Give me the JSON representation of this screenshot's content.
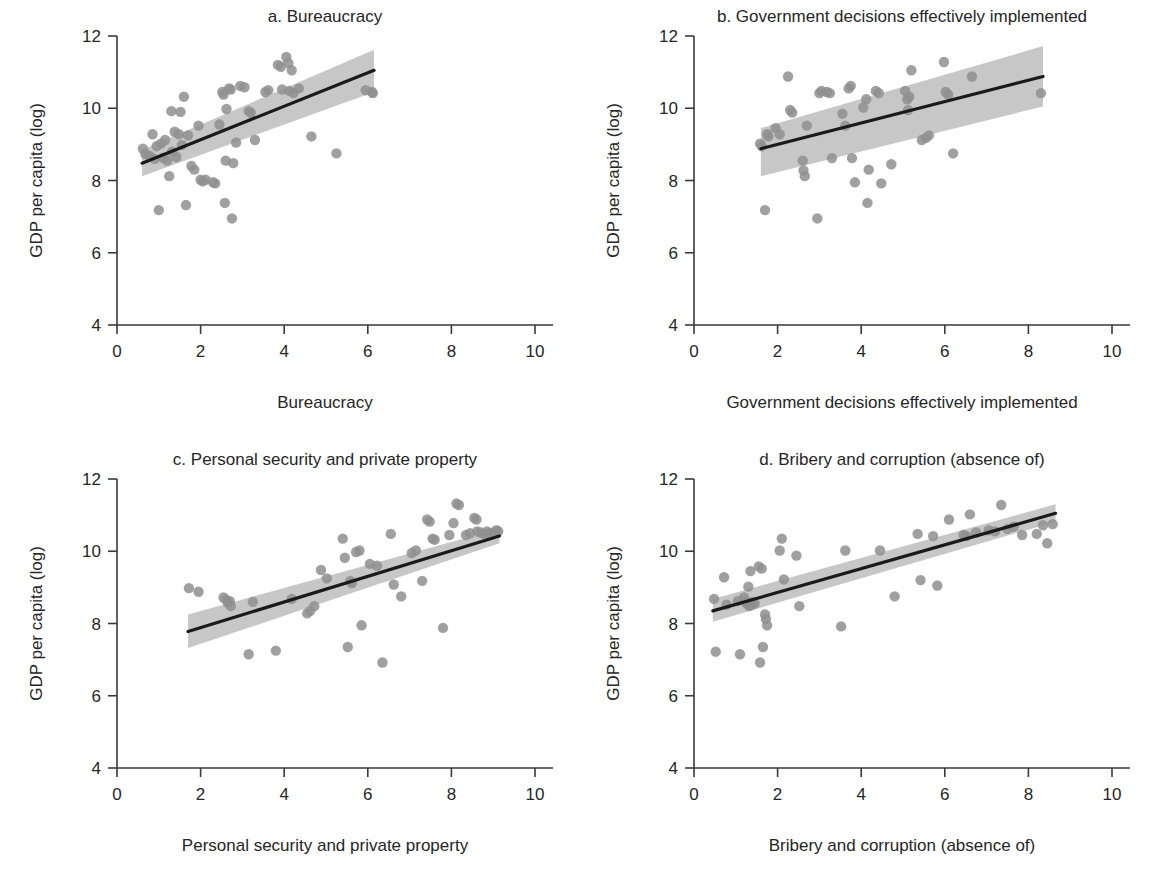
{
  "figure": {
    "background": "#ffffff",
    "point_color": "#8f8f8f",
    "band_color": "#b4b4b4",
    "line_color": "#1a1a1a",
    "axis_color": "#3a3a3a",
    "text_color": "#262626"
  },
  "chart_data": [
    {
      "id": "a",
      "type": "scatter",
      "title": "a. Bureaucracy",
      "xlabel": "Bureaucracy",
      "ylabel": "GDP per capita (log)",
      "xlim": [
        0,
        10
      ],
      "ylim": [
        4,
        12
      ],
      "xticks": [
        0,
        2,
        4,
        6,
        8,
        10
      ],
      "yticks": [
        4,
        6,
        8,
        10,
        12
      ],
      "grid": false,
      "legend": "none",
      "fit": {
        "x0": 0.6,
        "y0": 8.48,
        "x1": 6.15,
        "y1": 11.05
      },
      "band": {
        "x0": 0.6,
        "lo0": 8.12,
        "hi0": 8.85,
        "x1": 6.15,
        "lo1": 10.45,
        "hi1": 11.62
      },
      "points": [
        [
          0.62,
          8.88
        ],
        [
          0.68,
          8.73
        ],
        [
          0.78,
          8.68
        ],
        [
          0.85,
          9.28
        ],
        [
          0.9,
          8.6
        ],
        [
          0.95,
          8.95
        ],
        [
          1.0,
          7.18
        ],
        [
          1.05,
          9.02
        ],
        [
          1.1,
          8.63
        ],
        [
          1.15,
          9.12
        ],
        [
          1.2,
          8.55
        ],
        [
          1.25,
          8.12
        ],
        [
          1.3,
          9.92
        ],
        [
          1.32,
          8.8
        ],
        [
          1.38,
          9.35
        ],
        [
          1.42,
          8.65
        ],
        [
          1.48,
          9.28
        ],
        [
          1.52,
          9.9
        ],
        [
          1.55,
          8.98
        ],
        [
          1.6,
          10.32
        ],
        [
          1.65,
          7.32
        ],
        [
          1.7,
          9.25
        ],
        [
          1.78,
          8.4
        ],
        [
          1.85,
          8.3
        ],
        [
          1.95,
          9.52
        ],
        [
          2.0,
          8.02
        ],
        [
          2.05,
          7.98
        ],
        [
          2.12,
          8.02
        ],
        [
          2.3,
          7.95
        ],
        [
          2.35,
          7.92
        ],
        [
          2.45,
          9.55
        ],
        [
          2.52,
          10.45
        ],
        [
          2.55,
          10.38
        ],
        [
          2.58,
          7.38
        ],
        [
          2.6,
          8.55
        ],
        [
          2.62,
          9.98
        ],
        [
          2.68,
          10.55
        ],
        [
          2.72,
          10.52
        ],
        [
          2.75,
          6.95
        ],
        [
          2.78,
          8.48
        ],
        [
          2.85,
          9.05
        ],
        [
          2.95,
          10.62
        ],
        [
          3.05,
          10.58
        ],
        [
          3.15,
          9.92
        ],
        [
          3.2,
          9.88
        ],
        [
          3.3,
          9.12
        ],
        [
          3.55,
          10.45
        ],
        [
          3.62,
          10.5
        ],
        [
          3.85,
          11.2
        ],
        [
          3.92,
          11.15
        ],
        [
          3.95,
          10.52
        ],
        [
          4.05,
          11.42
        ],
        [
          4.1,
          11.25
        ],
        [
          4.12,
          10.48
        ],
        [
          4.18,
          11.05
        ],
        [
          4.22,
          10.42
        ],
        [
          4.35,
          10.55
        ],
        [
          4.65,
          9.22
        ],
        [
          5.25,
          8.75
        ],
        [
          5.95,
          10.5
        ],
        [
          6.1,
          10.45
        ],
        [
          6.12,
          10.42
        ]
      ]
    },
    {
      "id": "b",
      "type": "scatter",
      "title": "b. Government decisions effectively implemented",
      "xlabel": "Government decisions effectively implemented",
      "ylabel": "GDP per capita (log)",
      "xlim": [
        0,
        10
      ],
      "ylim": [
        4,
        12
      ],
      "xticks": [
        0,
        2,
        4,
        6,
        8,
        10
      ],
      "yticks": [
        4,
        6,
        8,
        10,
        12
      ],
      "grid": false,
      "legend": "none",
      "fit": {
        "x0": 1.6,
        "y0": 8.88,
        "x1": 8.35,
        "y1": 10.88
      },
      "band": {
        "x0": 1.6,
        "lo0": 8.12,
        "hi0": 9.45,
        "x1": 8.35,
        "lo1": 10.05,
        "hi1": 11.72
      },
      "points": [
        [
          1.58,
          9.02
        ],
        [
          1.62,
          8.95
        ],
        [
          1.7,
          7.18
        ],
        [
          1.75,
          9.28
        ],
        [
          1.78,
          9.22
        ],
        [
          1.95,
          9.45
        ],
        [
          2.05,
          9.28
        ],
        [
          2.25,
          10.88
        ],
        [
          2.3,
          9.95
        ],
        [
          2.35,
          9.88
        ],
        [
          2.6,
          8.55
        ],
        [
          2.62,
          8.28
        ],
        [
          2.65,
          8.12
        ],
        [
          2.7,
          9.52
        ],
        [
          2.95,
          6.95
        ],
        [
          3.0,
          10.42
        ],
        [
          3.05,
          10.48
        ],
        [
          3.18,
          10.45
        ],
        [
          3.25,
          10.42
        ],
        [
          3.3,
          8.62
        ],
        [
          3.55,
          9.85
        ],
        [
          3.62,
          9.52
        ],
        [
          3.7,
          10.55
        ],
        [
          3.75,
          10.62
        ],
        [
          3.78,
          8.62
        ],
        [
          3.85,
          7.95
        ],
        [
          4.05,
          10.02
        ],
        [
          4.12,
          10.25
        ],
        [
          4.15,
          7.38
        ],
        [
          4.18,
          8.3
        ],
        [
          4.35,
          10.48
        ],
        [
          4.42,
          10.42
        ],
        [
          4.48,
          7.92
        ],
        [
          4.72,
          8.45
        ],
        [
          5.05,
          10.48
        ],
        [
          5.1,
          10.25
        ],
        [
          5.12,
          9.95
        ],
        [
          5.15,
          10.32
        ],
        [
          5.2,
          11.05
        ],
        [
          5.45,
          9.12
        ],
        [
          5.55,
          9.18
        ],
        [
          5.62,
          9.25
        ],
        [
          5.98,
          11.28
        ],
        [
          6.02,
          10.45
        ],
        [
          6.08,
          10.38
        ],
        [
          6.2,
          8.75
        ],
        [
          6.65,
          10.88
        ],
        [
          8.3,
          10.42
        ]
      ]
    },
    {
      "id": "c",
      "type": "scatter",
      "title": "c. Personal security and private property",
      "xlabel": "Personal security and private property",
      "ylabel": "GDP per capita (log)",
      "xlim": [
        0,
        10
      ],
      "ylim": [
        4,
        12
      ],
      "xticks": [
        0,
        2,
        4,
        6,
        8,
        10
      ],
      "yticks": [
        4,
        6,
        8,
        10,
        12
      ],
      "grid": false,
      "legend": "none",
      "fit": {
        "x0": 1.7,
        "y0": 7.78,
        "x1": 9.15,
        "y1": 10.42
      },
      "band": {
        "x0": 1.7,
        "lo0": 7.32,
        "hi0": 8.25,
        "x1": 9.15,
        "lo1": 10.22,
        "hi1": 10.62
      },
      "points": [
        [
          1.72,
          8.98
        ],
        [
          1.95,
          8.88
        ],
        [
          2.55,
          8.72
        ],
        [
          2.62,
          8.65
        ],
        [
          2.65,
          8.58
        ],
        [
          2.7,
          8.62
        ],
        [
          2.72,
          8.48
        ],
        [
          3.15,
          7.15
        ],
        [
          3.25,
          8.6
        ],
        [
          3.8,
          7.25
        ],
        [
          4.18,
          8.68
        ],
        [
          4.55,
          8.28
        ],
        [
          4.62,
          8.35
        ],
        [
          4.72,
          8.48
        ],
        [
          4.88,
          9.48
        ],
        [
          5.02,
          9.25
        ],
        [
          5.4,
          10.35
        ],
        [
          5.45,
          9.82
        ],
        [
          5.52,
          7.35
        ],
        [
          5.58,
          9.18
        ],
        [
          5.62,
          9.12
        ],
        [
          5.72,
          9.98
        ],
        [
          5.8,
          10.02
        ],
        [
          5.85,
          7.95
        ],
        [
          6.05,
          9.65
        ],
        [
          6.22,
          9.6
        ],
        [
          6.35,
          6.92
        ],
        [
          6.55,
          10.48
        ],
        [
          6.62,
          9.08
        ],
        [
          6.8,
          8.75
        ],
        [
          7.05,
          9.95
        ],
        [
          7.15,
          10.02
        ],
        [
          7.3,
          9.18
        ],
        [
          7.42,
          10.88
        ],
        [
          7.48,
          10.82
        ],
        [
          7.55,
          10.35
        ],
        [
          7.6,
          10.32
        ],
        [
          7.8,
          7.88
        ],
        [
          7.95,
          10.45
        ],
        [
          8.05,
          10.78
        ],
        [
          8.12,
          11.32
        ],
        [
          8.18,
          11.28
        ],
        [
          8.35,
          10.45
        ],
        [
          8.45,
          10.5
        ],
        [
          8.55,
          10.92
        ],
        [
          8.6,
          10.88
        ],
        [
          8.62,
          10.55
        ],
        [
          8.7,
          10.52
        ],
        [
          8.78,
          10.48
        ],
        [
          8.85,
          10.55
        ],
        [
          8.9,
          10.5
        ],
        [
          9.0,
          10.52
        ],
        [
          9.08,
          10.58
        ],
        [
          9.12,
          10.55
        ]
      ]
    },
    {
      "id": "d",
      "type": "scatter",
      "title": "d. Bribery and corruption (absence of)",
      "xlabel": "Bribery and corruption (absence of)",
      "ylabel": "GDP per capita (log)",
      "xlim": [
        0,
        10
      ],
      "ylim": [
        4,
        12
      ],
      "xticks": [
        0,
        2,
        4,
        6,
        8,
        10
      ],
      "yticks": [
        4,
        6,
        8,
        10,
        12
      ],
      "grid": false,
      "legend": "none",
      "fit": {
        "x0": 0.45,
        "y0": 8.35,
        "x1": 8.65,
        "y1": 11.05
      },
      "band": {
        "x0": 0.45,
        "lo0": 8.05,
        "hi0": 8.68,
        "x1": 8.65,
        "lo1": 10.82,
        "hi1": 11.3
      },
      "points": [
        [
          0.48,
          8.68
        ],
        [
          0.52,
          7.22
        ],
        [
          0.72,
          9.28
        ],
        [
          0.78,
          8.52
        ],
        [
          1.05,
          8.62
        ],
        [
          1.1,
          7.15
        ],
        [
          1.2,
          8.72
        ],
        [
          1.25,
          8.58
        ],
        [
          1.28,
          8.55
        ],
        [
          1.3,
          9.02
        ],
        [
          1.32,
          8.48
        ],
        [
          1.35,
          9.45
        ],
        [
          1.38,
          8.52
        ],
        [
          1.4,
          8.6
        ],
        [
          1.45,
          8.55
        ],
        [
          1.55,
          9.58
        ],
        [
          1.58,
          6.92
        ],
        [
          1.62,
          9.52
        ],
        [
          1.65,
          7.35
        ],
        [
          1.7,
          8.25
        ],
        [
          1.72,
          8.12
        ],
        [
          1.75,
          7.95
        ],
        [
          2.05,
          10.02
        ],
        [
          2.1,
          10.35
        ],
        [
          2.15,
          9.22
        ],
        [
          2.45,
          9.88
        ],
        [
          2.52,
          8.48
        ],
        [
          3.52,
          7.92
        ],
        [
          3.62,
          10.02
        ],
        [
          4.45,
          10.02
        ],
        [
          4.8,
          8.75
        ],
        [
          5.35,
          10.48
        ],
        [
          5.42,
          9.2
        ],
        [
          5.72,
          10.42
        ],
        [
          5.82,
          9.05
        ],
        [
          6.1,
          10.88
        ],
        [
          6.45,
          10.45
        ],
        [
          6.52,
          10.42
        ],
        [
          6.6,
          11.02
        ],
        [
          6.75,
          10.52
        ],
        [
          7.05,
          10.58
        ],
        [
          7.2,
          10.55
        ],
        [
          7.35,
          11.28
        ],
        [
          7.5,
          10.62
        ],
        [
          7.65,
          10.68
        ],
        [
          7.85,
          10.45
        ],
        [
          8.2,
          10.48
        ],
        [
          8.35,
          10.72
        ],
        [
          8.45,
          10.22
        ],
        [
          8.58,
          10.75
        ]
      ]
    }
  ]
}
